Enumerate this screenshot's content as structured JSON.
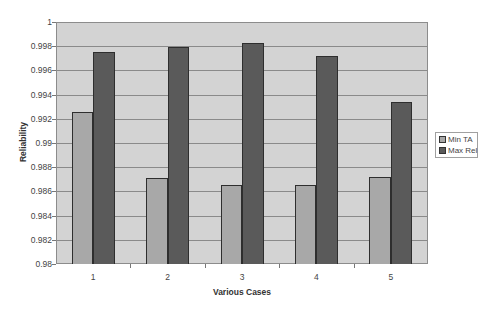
{
  "chart_data": {
    "type": "bar",
    "title": "",
    "xlabel": "Various Cases",
    "ylabel": "Reliability",
    "categories": [
      "1",
      "2",
      "3",
      "4",
      "5"
    ],
    "series": [
      {
        "name": "Min TA",
        "color": "#a8a8a8",
        "values": [
          0.9926,
          0.9871,
          0.9865,
          0.9865,
          0.9872
        ]
      },
      {
        "name": "Max Rel",
        "color": "#5a5a5a",
        "values": [
          0.9975,
          0.9979,
          0.9983,
          0.9972,
          0.9934
        ]
      }
    ],
    "ylim": [
      0.98,
      1.0
    ],
    "yticks": [
      "0.98",
      "0.982",
      "0.984",
      "0.986",
      "0.988",
      "0.99",
      "0.992",
      "0.994",
      "0.996",
      "0.998",
      "1"
    ],
    "grid": true,
    "legend_position": "right",
    "colors": {
      "plot_background": "#d3d3d3",
      "gridline": "#8a8a8a",
      "bar_border": "#2e2e2e"
    }
  }
}
